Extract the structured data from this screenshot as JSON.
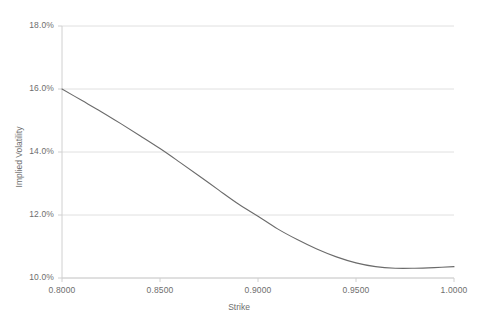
{
  "chart_data": {
    "type": "line",
    "title": "",
    "xlabel": "Strike",
    "ylabel": "Implied Volatility",
    "xlim": [
      0.8,
      1.0
    ],
    "ylim": [
      0.1,
      0.18
    ],
    "grid": true,
    "legend": "none",
    "x_tick_labels": [
      "0.8000",
      "0.8500",
      "0.9000",
      "0.9500",
      "1.0000"
    ],
    "x_tick_values": [
      0.8,
      0.85,
      0.9,
      0.95,
      1.0
    ],
    "y_tick_labels": [
      "10.0%",
      "12.0%",
      "14.0%",
      "16.0%",
      "18.0%"
    ],
    "y_tick_values": [
      0.1,
      0.12,
      0.14,
      0.16,
      0.18
    ],
    "series": [
      {
        "name": "Implied Volatility",
        "color": "#6b6b6b",
        "x": [
          0.8,
          0.81,
          0.82,
          0.83,
          0.84,
          0.85,
          0.86,
          0.87,
          0.88,
          0.89,
          0.9,
          0.91,
          0.92,
          0.93,
          0.94,
          0.95,
          0.96,
          0.97,
          0.98,
          0.99,
          1.0
        ],
        "values": [
          0.16,
          0.1564,
          0.1528,
          0.149,
          0.1451,
          0.1411,
          0.1368,
          0.1324,
          0.1279,
          0.1235,
          0.1196,
          0.1156,
          0.1122,
          0.1092,
          0.1067,
          0.1048,
          0.1036,
          0.1031,
          0.1031,
          0.1033,
          0.1036
        ]
      }
    ]
  },
  "axis_title_color": "#6e6e6e",
  "gridline_color": "#e0e0e0",
  "axis_line_color": "#d0d0d0"
}
